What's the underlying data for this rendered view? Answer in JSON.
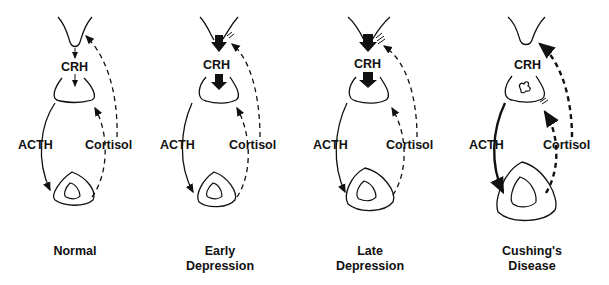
{
  "diagram": {
    "labels": {
      "crh": "CRH",
      "acth": "ACTH",
      "cortisol": "Cortisol"
    },
    "panels": [
      {
        "id": "normal",
        "caption_line1": "Normal",
        "caption_line2": ""
      },
      {
        "id": "early",
        "caption_line1": "Early",
        "caption_line2": "Depression"
      },
      {
        "id": "late",
        "caption_line1": "Late",
        "caption_line2": "Depression"
      },
      {
        "id": "cushings",
        "caption_line1": "Cushing's",
        "caption_line2": "Disease"
      }
    ]
  }
}
